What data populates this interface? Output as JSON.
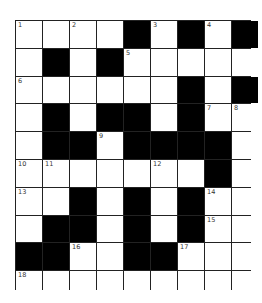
{
  "puzzle": {
    "rows": 10,
    "cols": 9,
    "colors": {
      "block": "#000000",
      "open": "#ffffff",
      "border": "#222222"
    },
    "grid": [
      [
        "1",
        "",
        "2",
        "",
        "#",
        "3",
        "#",
        "4",
        "#"
      ],
      [
        "",
        "#",
        "",
        "#",
        "5",
        "",
        "",
        "",
        ""
      ],
      [
        "6",
        "",
        "",
        "",
        "",
        "",
        "#",
        "",
        "#"
      ],
      [
        "",
        "#",
        "",
        "#",
        "#",
        "",
        "#",
        "7",
        "8"
      ],
      [
        "",
        "#",
        "#",
        "9",
        "#",
        "#",
        "#",
        "#",
        ""
      ],
      [
        "10",
        "11",
        "",
        "",
        "",
        "12",
        "",
        "#",
        ""
      ],
      [
        "13",
        "",
        "#",
        "",
        "#",
        "",
        "#",
        "14",
        ""
      ],
      [
        "",
        "#",
        "#",
        "",
        "#",
        "",
        "#",
        "15",
        ""
      ],
      [
        "#",
        "#",
        "16",
        "",
        "#",
        "#",
        "17",
        "",
        ""
      ],
      [
        "18",
        "",
        "",
        "",
        "",
        "",
        "",
        "",
        ""
      ]
    ]
  }
}
